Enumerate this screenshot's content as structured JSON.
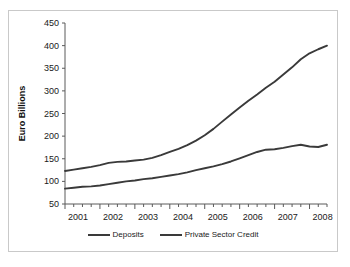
{
  "figure": {
    "title_fragment": "",
    "border_color": "#c9c9c9",
    "background": "#ffffff",
    "series_color": "#3a3a3a"
  },
  "axes": {
    "y_axis_title": "Euro Billions",
    "y_ticks": [
      "450",
      "400",
      "350",
      "300",
      "250",
      "200",
      "150",
      "100",
      "50"
    ],
    "x_ticks": [
      "2001",
      "2002",
      "2003",
      "2004",
      "2005",
      "2006",
      "2007",
      "2008"
    ]
  },
  "legend": {
    "items": [
      {
        "label": "Deposits"
      },
      {
        "label": "Private Sector Credit"
      }
    ]
  },
  "chart_data": {
    "type": "line",
    "title": "",
    "xlabel": "",
    "ylabel": "Euro Billions",
    "ylim": [
      50,
      450
    ],
    "ytick_step": 50,
    "grid": false,
    "legend_position": "bottom",
    "x_axis_kind": "quarterly",
    "x_tick_labels": [
      "2001",
      "2002",
      "2003",
      "2004",
      "2005",
      "2006",
      "2007",
      "2008"
    ],
    "x": [
      "2001Q1",
      "2001Q2",
      "2001Q3",
      "2001Q4",
      "2002Q1",
      "2002Q2",
      "2002Q3",
      "2002Q4",
      "2003Q1",
      "2003Q2",
      "2003Q3",
      "2003Q4",
      "2004Q1",
      "2004Q2",
      "2004Q3",
      "2004Q4",
      "2005Q1",
      "2005Q2",
      "2005Q3",
      "2005Q4",
      "2006Q1",
      "2006Q2",
      "2006Q3",
      "2006Q4",
      "2007Q1",
      "2007Q2",
      "2007Q3",
      "2007Q4",
      "2008Q1",
      "2008Q2",
      "2008Q3"
    ],
    "series": [
      {
        "name": "Deposits",
        "color": "#3a3a3a",
        "values": [
          84,
          86,
          88,
          89,
          91,
          94,
          97,
          100,
          102,
          105,
          107,
          110,
          113,
          116,
          120,
          125,
          129,
          133,
          138,
          144,
          151,
          158,
          165,
          170,
          171,
          174,
          178,
          181,
          177,
          176,
          181
        ],
        "last_value": 171
      },
      {
        "name": "Private Sector Credit",
        "color": "#3a3a3a",
        "values": [
          123,
          126,
          129,
          132,
          136,
          141,
          143,
          144,
          146,
          148,
          152,
          158,
          165,
          172,
          180,
          190,
          202,
          216,
          232,
          248,
          263,
          278,
          292,
          307,
          320,
          336,
          352,
          370,
          383,
          392,
          400
        ],
        "last_value": 394
      }
    ],
    "annotations": []
  }
}
